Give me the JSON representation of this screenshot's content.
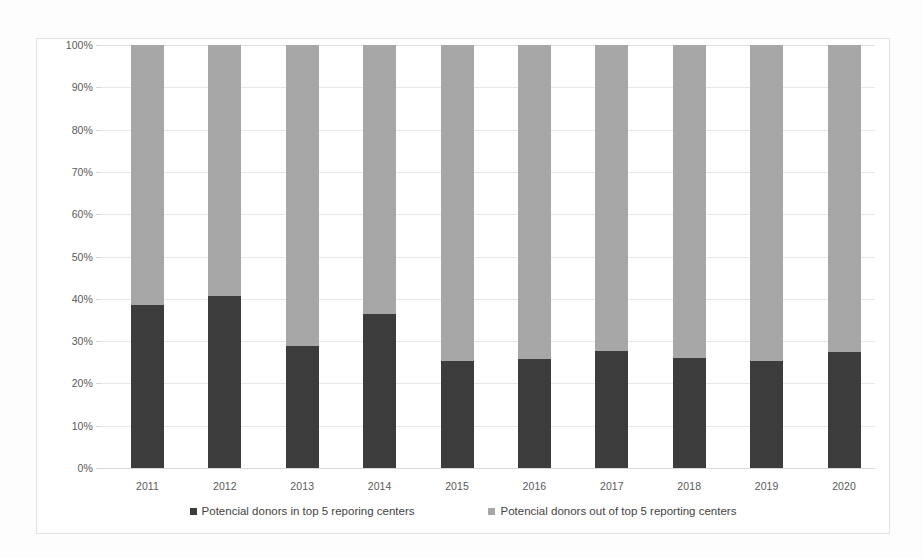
{
  "chart_data": {
    "type": "bar",
    "subtype": "stacked-100-percent",
    "title": "",
    "xlabel": "",
    "ylabel": "",
    "ylim": [
      0,
      100
    ],
    "ytick_labels": [
      "100%",
      "90%",
      "80%",
      "70%",
      "60%",
      "50%",
      "40%",
      "30%",
      "20%",
      "10%",
      "0%"
    ],
    "ytick_values": [
      100,
      90,
      80,
      70,
      60,
      50,
      40,
      30,
      20,
      10,
      0
    ],
    "grid": true,
    "legend_position": "bottom",
    "categories": [
      "2011",
      "2012",
      "2013",
      "2014",
      "2015",
      "2016",
      "2017",
      "2018",
      "2019",
      "2020"
    ],
    "series": [
      {
        "name": "Potencial donors in top 5 reporing centers",
        "color": "#3c3c3c",
        "stack_position": "bottom",
        "values": [
          38.5,
          40.7,
          28.8,
          36.4,
          25.3,
          25.8,
          27.7,
          26.0,
          25.2,
          27.5
        ]
      },
      {
        "name": "Potencial donors out of top 5 reporting centers",
        "color": "#a7a7a7",
        "stack_position": "top",
        "values": [
          61.5,
          59.3,
          71.2,
          63.6,
          74.7,
          74.2,
          72.3,
          74.0,
          74.8,
          72.5
        ]
      }
    ]
  },
  "legend": {
    "entries": [
      {
        "label": "Potencial donors in top 5 reporing centers",
        "color": "#3c3c3c"
      },
      {
        "label": "Potencial donors out of top 5 reporting centers",
        "color": "#a7a7a7"
      }
    ]
  }
}
